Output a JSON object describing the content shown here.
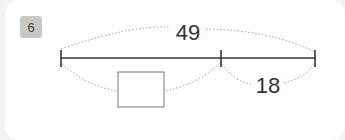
{
  "problem": {
    "number": "6"
  },
  "diagram": {
    "total_label": "49",
    "right_label": "18",
    "left_label": "",
    "colors": {
      "line": "#333333",
      "dotted": "#999999",
      "box": "#777777",
      "badge": "#c8c8c8"
    }
  }
}
